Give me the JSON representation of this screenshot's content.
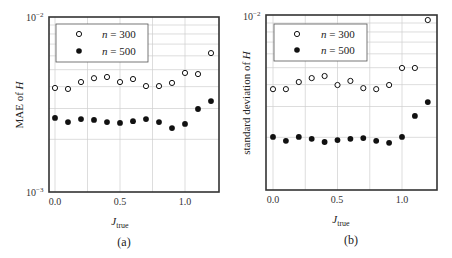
{
  "chart_data": [
    {
      "panel": "(a)",
      "type": "scatter",
      "title": "",
      "xlabel": "J_true",
      "ylabel": "MAE of H",
      "yscale": "log",
      "ylim": [
        0.001,
        0.01
      ],
      "xlim": [
        -0.05,
        1.25
      ],
      "xticks": [
        "0.0",
        "0.5",
        "1.0"
      ],
      "yticks": [
        "10^-3",
        "10^-2"
      ],
      "grid": true,
      "legend_position": "upper left",
      "x": [
        0.0,
        0.1,
        0.2,
        0.3,
        0.4,
        0.5,
        0.6,
        0.7,
        0.8,
        0.9,
        1.0,
        1.1,
        1.2
      ],
      "series": [
        {
          "name": "n = 300",
          "marker": "open-circle",
          "values": [
            0.00393,
            0.00388,
            0.00425,
            0.00447,
            0.00454,
            0.00425,
            0.00442,
            0.00403,
            0.00403,
            0.0042,
            0.00479,
            0.00472,
            0.00622
          ]
        },
        {
          "name": "n = 500",
          "marker": "filled-circle",
          "values": [
            0.00265,
            0.00251,
            0.00261,
            0.00258,
            0.00251,
            0.00248,
            0.00254,
            0.00261,
            0.00251,
            0.00232,
            0.00245,
            0.00298,
            0.00331
          ]
        }
      ]
    },
    {
      "panel": "(b)",
      "type": "scatter",
      "title": "",
      "xlabel": "J_true",
      "ylabel": "standard deviation of H",
      "yscale": "log",
      "ylim": [
        0.001,
        0.01
      ],
      "xlim": [
        -0.05,
        1.25
      ],
      "xticks": [
        "0.0",
        "0.5",
        "1.0"
      ],
      "yticks": [
        "10^-2"
      ],
      "grid": true,
      "legend_position": "upper left",
      "x": [
        0.0,
        0.1,
        0.2,
        0.3,
        0.4,
        0.5,
        0.6,
        0.7,
        0.8,
        0.9,
        1.0,
        1.1,
        1.2
      ],
      "series": [
        {
          "name": "n = 300",
          "marker": "open-circle",
          "values": [
            0.00377,
            0.00377,
            0.00414,
            0.00436,
            0.00448,
            0.00398,
            0.0042,
            0.00382,
            0.00377,
            0.00398,
            0.00498,
            0.00498,
            0.00936
          ]
        },
        {
          "name": "n = 500",
          "marker": "filled-circle",
          "values": [
            0.00201,
            0.00191,
            0.00201,
            0.00196,
            0.00188,
            0.00193,
            0.00196,
            0.00198,
            0.00191,
            0.00186,
            0.00201,
            0.00265,
            0.00318
          ]
        }
      ]
    }
  ],
  "panels": [
    {
      "caption": "(a)",
      "ylabel": "MAE of H",
      "ylabel_main": "MAE of ",
      "ylabel_var": "H",
      "xlabel_main": "J",
      "xlabel_sub": "true",
      "ytick_top_base": "10",
      "ytick_top_exp": "−2",
      "ytick_bottom_base": "10",
      "ytick_bottom_exp": "−3",
      "xticks": [
        "0.0",
        "0.5",
        "1.0"
      ],
      "legend": [
        {
          "var": "n",
          "rest": " = 300"
        },
        {
          "var": "n",
          "rest": " = 500"
        }
      ]
    },
    {
      "caption": "(b)",
      "ylabel": "standard deviation of H",
      "ylabel_main": "standard deviation of ",
      "ylabel_var": "H",
      "xlabel_main": "J",
      "xlabel_sub": "true",
      "ytick_top_base": "10",
      "ytick_top_exp": "−2",
      "xticks": [
        "0.0",
        "0.5",
        "1.0"
      ],
      "legend": [
        {
          "var": "n",
          "rest": " = 300"
        },
        {
          "var": "n",
          "rest": " = 500"
        }
      ]
    }
  ],
  "colors": {
    "frame": "#333333",
    "grid": "#cfcfcf",
    "marker": "#111111",
    "background": "#ffffff"
  }
}
